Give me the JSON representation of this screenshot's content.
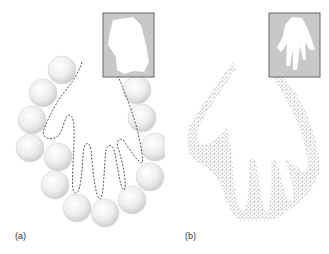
{
  "figure": {
    "panels": [
      {
        "id": "a",
        "label": "(a)",
        "description": "Chain of spheres surrounding a dashed hand outline; inset shows a coarse silhouette",
        "inset": "coarse-hand-silhouette",
        "sphere_count": 13
      },
      {
        "id": "b",
        "label": "(b)",
        "description": "Hand shape formed by dense dotted particles; inset shows refined hand silhouette",
        "inset": "refined-hand-silhouette"
      }
    ],
    "colors": {
      "inset_bg": "#c8c8c8",
      "inset_border": "#666666",
      "sphere": "#e6e6e6",
      "dashes": "#555555",
      "dots": "#c4c4c4"
    }
  }
}
